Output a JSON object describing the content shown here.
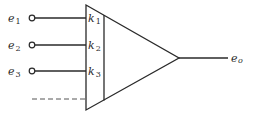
{
  "diagram": {
    "type": "summing-amplifier-block",
    "inputs": [
      {
        "name": "e",
        "sub": "1",
        "gain_name": "k",
        "gain_sub": "1"
      },
      {
        "name": "e",
        "sub": "2",
        "gain_name": "k",
        "gain_sub": "2"
      },
      {
        "name": "e",
        "sub": "3",
        "gain_name": "k",
        "gain_sub": "3"
      }
    ],
    "additional_inputs_indicator": "dashed",
    "output": {
      "name": "e",
      "sub": "o"
    },
    "colors": {
      "stroke": "#2a2a2a",
      "background": "#ffffff"
    }
  }
}
